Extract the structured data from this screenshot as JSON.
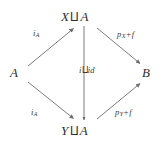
{
  "diagram": {
    "kind": "commutative-diagram",
    "shape": "diamond",
    "background_color": "#ffffff",
    "stroke_color": "#6d6d70",
    "text_color": "#2e2e30",
    "nodes": {
      "left": {
        "id": "A",
        "symbol": "A",
        "operator": "",
        "operand": "",
        "x": 18,
        "y": 72
      },
      "top": {
        "id": "XuA",
        "symbol": "X",
        "operator": "⨿",
        "operand": "A",
        "x": 81,
        "y": 17
      },
      "bottom": {
        "id": "YuA",
        "symbol": "Y",
        "operator": "⨿",
        "operand": "A",
        "x": 81,
        "y": 131
      },
      "right": {
        "id": "B",
        "symbol": "B",
        "operator": "",
        "operand": "",
        "x": 147,
        "y": 72
      }
    },
    "edges": [
      {
        "name": "edge-a-to-xua",
        "from": "A",
        "to": "X ⨿ A",
        "label": "i",
        "label_sub": "A",
        "label_plus": "",
        "label_tail": "",
        "direction": "up-right",
        "x1": 28,
        "y1": 66,
        "x2": 74,
        "y2": 28
      },
      {
        "name": "edge-a-to-yua",
        "from": "A",
        "to": "Y ⨿ A",
        "label": "i",
        "label_sub": "A",
        "label_plus": "",
        "label_tail": "",
        "direction": "down-right",
        "x1": 28,
        "y1": 82,
        "x2": 74,
        "y2": 119
      },
      {
        "name": "edge-xua-to-b",
        "from": "X ⨿ A",
        "to": "B",
        "label": "p",
        "label_sub": "X",
        "label_plus": "+",
        "label_tail": "f",
        "direction": "down-right",
        "x1": 97,
        "y1": 28,
        "x2": 140,
        "y2": 64
      },
      {
        "name": "edge-yua-to-b",
        "from": "Y ⨿ A",
        "to": "B",
        "label": "p",
        "label_sub": "Y",
        "label_plus": "+",
        "label_tail": "f",
        "direction": "up-right",
        "x1": 97,
        "y1": 119,
        "x2": 140,
        "y2": 83
      },
      {
        "name": "edge-xua-to-yua",
        "from": "X ⨿ A",
        "to": "Y ⨿ A",
        "label": "i",
        "label_sub": "",
        "label_plus": "⨿",
        "label_tail": "id",
        "direction": "down",
        "x1": 84,
        "y1": 26,
        "x2": 84,
        "y2": 121
      }
    ]
  }
}
